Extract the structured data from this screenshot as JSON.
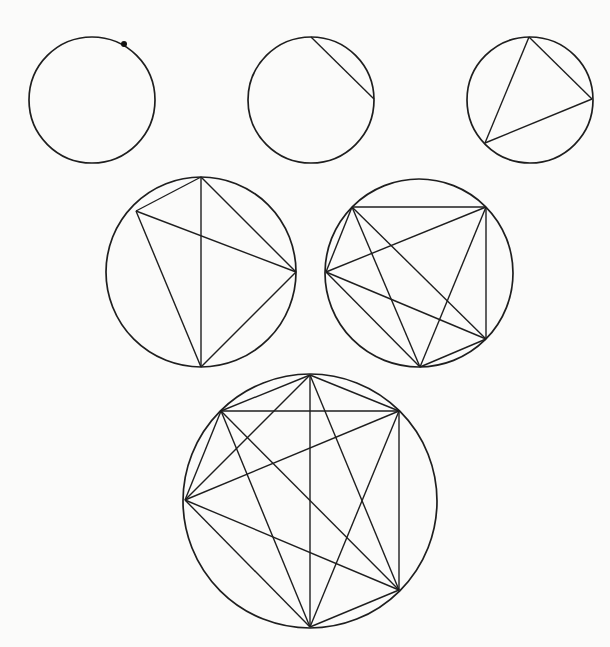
{
  "figure": {
    "caption": "",
    "stroke_color": "#1e1e1e",
    "background_color": "#fbfbfa",
    "diagrams": [
      {
        "id": "circle-1-point",
        "points_on_circle": 1,
        "regions": 1,
        "center": [
          92,
          100
        ],
        "radius": 63,
        "points": [
          [
            124,
            44
          ]
        ],
        "chords": []
      },
      {
        "id": "circle-2-points",
        "points_on_circle": 2,
        "regions": 2,
        "center": [
          311,
          100
        ],
        "radius": 63,
        "points": [
          [
            311,
            37
          ],
          [
            374,
            99
          ]
        ],
        "chords": [
          [
            0,
            1
          ]
        ]
      },
      {
        "id": "circle-3-points",
        "points_on_circle": 3,
        "regions": 4,
        "center": [
          530,
          100
        ],
        "radius": 63,
        "points": [
          [
            529,
            37
          ],
          [
            592,
            99
          ],
          [
            485,
            143
          ]
        ],
        "chords": [
          [
            0,
            1
          ],
          [
            1,
            2
          ],
          [
            2,
            0
          ]
        ]
      },
      {
        "id": "circle-4-points",
        "points_on_circle": 4,
        "regions": 8,
        "center": [
          201,
          272
        ],
        "radius": 95,
        "points": [
          [
            201,
            177
          ],
          [
            136,
            211
          ],
          [
            296,
            272
          ],
          [
            201,
            367
          ]
        ],
        "chords": [
          [
            0,
            1
          ],
          [
            0,
            2
          ],
          [
            0,
            3
          ],
          [
            1,
            2
          ],
          [
            1,
            3
          ],
          [
            2,
            3
          ]
        ]
      },
      {
        "id": "circle-5-points",
        "points_on_circle": 5,
        "regions": 16,
        "center": [
          419,
          273
        ],
        "radius": 94,
        "points": [
          [
            352,
            207
          ],
          [
            486,
            207
          ],
          [
            326,
            272
          ],
          [
            486,
            339
          ],
          [
            420,
            367
          ]
        ],
        "chords": [
          [
            0,
            1
          ],
          [
            0,
            2
          ],
          [
            0,
            3
          ],
          [
            0,
            4
          ],
          [
            1,
            2
          ],
          [
            1,
            3
          ],
          [
            1,
            4
          ],
          [
            2,
            3
          ],
          [
            2,
            4
          ],
          [
            3,
            4
          ]
        ]
      },
      {
        "id": "circle-6-points",
        "points_on_circle": 6,
        "regions": 31,
        "center": [
          310,
          501
        ],
        "radius": 127,
        "points": [
          [
            310,
            375
          ],
          [
            221,
            411
          ],
          [
            399,
            411
          ],
          [
            185,
            500
          ],
          [
            399,
            590
          ],
          [
            310,
            627
          ]
        ],
        "chords": [
          [
            0,
            1
          ],
          [
            0,
            2
          ],
          [
            0,
            3
          ],
          [
            0,
            4
          ],
          [
            0,
            5
          ],
          [
            1,
            2
          ],
          [
            1,
            3
          ],
          [
            1,
            4
          ],
          [
            1,
            5
          ],
          [
            2,
            3
          ],
          [
            2,
            4
          ],
          [
            2,
            5
          ],
          [
            3,
            4
          ],
          [
            3,
            5
          ],
          [
            4,
            5
          ]
        ]
      }
    ]
  }
}
